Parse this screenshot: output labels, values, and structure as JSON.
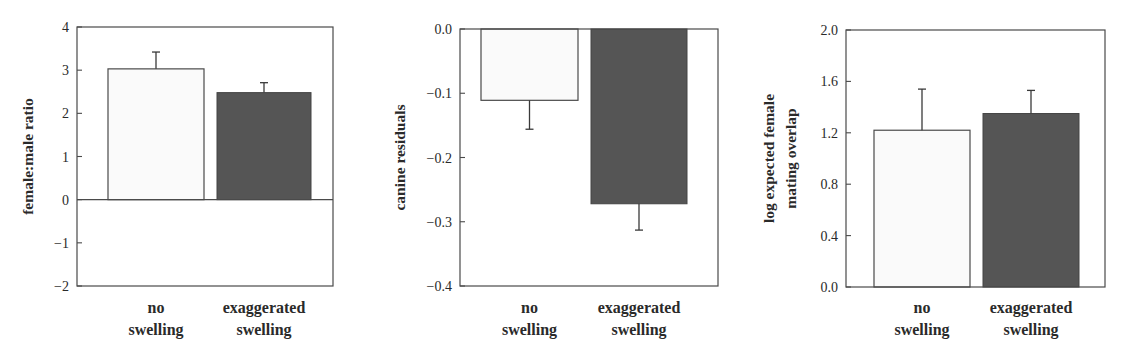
{
  "chart_data": [
    {
      "type": "bar",
      "title": "",
      "xlabel": "",
      "ylabel": "female:male ratio",
      "ylim": [
        -2,
        4
      ],
      "yticks": [
        4,
        3,
        2,
        1,
        0,
        -1,
        -2
      ],
      "ytick_labels": [
        "4",
        "3",
        "2",
        "1",
        "0",
        "−1",
        "−2"
      ],
      "grid": false,
      "legend": null,
      "zero_line": true,
      "categories": [
        [
          "no",
          "swelling"
        ],
        [
          "exaggerated",
          "swelling"
        ]
      ],
      "values": [
        3.03,
        2.48
      ],
      "error_bars_upper": [
        3.42,
        2.71
      ],
      "bar_colors": [
        "#fafafa",
        "#555555"
      ],
      "frame": {
        "x0": 77,
        "y0": 27,
        "x1": 333,
        "y1": 286
      },
      "bars_px": [
        [
          108,
          204
        ],
        [
          217,
          311
        ]
      ],
      "ylabel_x": [
        28
      ]
    },
    {
      "type": "bar",
      "title": "",
      "xlabel": "",
      "ylabel": "canine residuals",
      "ylim": [
        -0.4,
        0.0
      ],
      "yticks": [
        0.0,
        -0.1,
        -0.2,
        -0.3,
        -0.4
      ],
      "ytick_labels": [
        "0.0",
        "−0.1",
        "−0.2",
        "−0.3",
        "−0.4"
      ],
      "grid": false,
      "legend": null,
      "zero_line": false,
      "categories": [
        [
          "no",
          "swelling"
        ],
        [
          "exaggerated",
          "swelling"
        ]
      ],
      "values": [
        -0.111,
        -0.272
      ],
      "error_bars_lower": [
        -0.156,
        -0.313
      ],
      "bar_colors": [
        "#fafafa",
        "#555555"
      ],
      "frame": {
        "x0": 460,
        "y0": 29,
        "x1": 718,
        "y1": 286
      },
      "bars_px": [
        [
          481,
          578
        ],
        [
          591,
          687
        ]
      ],
      "ylabel_x": [
        400
      ]
    },
    {
      "type": "bar",
      "title": "",
      "xlabel": "",
      "ylabel": [
        "log expected female",
        "mating overlap"
      ],
      "ylim": [
        0.0,
        2.0
      ],
      "yticks": [
        2.0,
        1.6,
        1.2,
        0.8,
        0.4,
        0.0
      ],
      "ytick_labels": [
        "2.0",
        "1.6",
        "1.2",
        "0.8",
        "0.4",
        "0.0"
      ],
      "grid": false,
      "legend": null,
      "zero_line": false,
      "categories": [
        [
          "no",
          "swelling"
        ],
        [
          "exaggerated",
          "swelling"
        ]
      ],
      "values": [
        1.22,
        1.35
      ],
      "error_bars_upper": [
        1.54,
        1.53
      ],
      "bar_colors": [
        "#fafafa",
        "#555555"
      ],
      "frame": {
        "x0": 846,
        "y0": 30,
        "x1": 1105,
        "y1": 287
      },
      "bars_px": [
        [
          874,
          970
        ],
        [
          983,
          1079
        ]
      ],
      "ylabel_x": [
        769,
        791
      ]
    }
  ]
}
